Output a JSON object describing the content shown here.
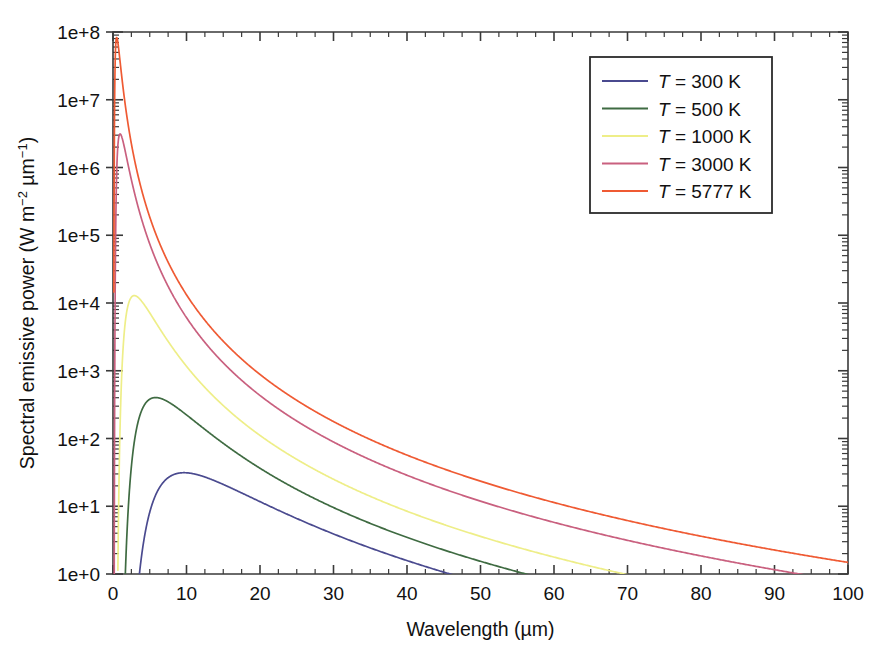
{
  "chart_data": {
    "type": "line",
    "title": "",
    "xlabel": "Wavelength (µm)",
    "ylabel": "Spectral emissive power (W m⁻² µm⁻¹)",
    "ylabel_parts": {
      "main": "Spectral emissive power (W m",
      "sup1": "−2",
      "mid": " µm",
      "sup2": "−1",
      "tail": ")"
    },
    "xlim": [
      0,
      100
    ],
    "ylim": [
      1,
      100000000
    ],
    "yscale": "log",
    "xscale": "linear",
    "grid": false,
    "legend_position": "upper right",
    "x_ticks": [
      0,
      10,
      20,
      30,
      40,
      50,
      60,
      70,
      80,
      90,
      100
    ],
    "x_tick_labels": [
      "0",
      "10",
      "20",
      "30",
      "40",
      "50",
      "60",
      "70",
      "80",
      "90",
      "100"
    ],
    "x_minor_step": 2.5,
    "y_ticks": [
      1,
      10,
      100,
      1000,
      10000,
      100000,
      1000000,
      10000000,
      100000000
    ],
    "y_tick_labels": [
      "1e+0",
      "1e+1",
      "1e+2",
      "1e+3",
      "1e+4",
      "1e+5",
      "1e+6",
      "1e+7",
      "1e+8"
    ],
    "series": [
      {
        "name": "T = 300 K",
        "label_prefix": "T",
        "label_eq": "=",
        "label_value": "300 K",
        "temperature": 300,
        "color": "#4a4a8f",
        "peak_wavelength_um": 9.66,
        "peak_value": 31.0,
        "x": [
          0.5,
          1,
          1.5,
          2,
          2.5,
          3,
          3.5,
          4,
          4.5,
          5,
          6,
          7,
          8,
          9,
          9.66,
          10,
          11,
          12,
          14,
          16,
          18,
          20,
          24,
          28,
          32,
          36,
          40,
          44,
          45.5
        ],
        "y": [
          2.6e-15,
          8.8e-07,
          0.000573,
          0.0202,
          0.1627,
          0.6299,
          1.6127,
          3.2155,
          5.4263,
          7.9853,
          14.03,
          19.54,
          24.02,
          27.24,
          28.53,
          29.04,
          30.0,
          30.1,
          28.15,
          24.9,
          21.5,
          18.3,
          13.1,
          9.4,
          6.9,
          5.2,
          3.97,
          3.08,
          2.84
        ]
      },
      {
        "name": "T = 500 K",
        "label_prefix": "T",
        "label_eq": "=",
        "label_value": "500 K",
        "temperature": 500,
        "color": "#3f6b42",
        "peak_wavelength_um": 5.8,
        "peak_value": 410.0,
        "x": [
          0.5,
          1,
          1.5,
          2,
          2.5,
          3,
          3.5,
          4,
          4.5,
          5,
          5.5,
          5.8,
          6,
          7,
          8,
          9,
          10,
          12,
          14,
          17,
          20,
          25,
          30,
          36,
          42,
          50,
          56
        ],
        "y": [
          1.5e-06,
          0.313,
          8.05,
          36.5,
          82.5,
          139.6,
          195.8,
          245.1,
          285.3,
          316.3,
          339.0,
          348.0,
          353.2,
          363.0,
          359.4,
          348.0,
          332.8,
          297.0,
          261.0,
          212.0,
          172.0,
          123.0,
          90.0,
          64.0,
          47.0,
          32.0,
          24.5
        ]
      },
      {
        "name": "T = 1000 K",
        "label_prefix": "T",
        "label_eq": "=",
        "label_value": "1000 K",
        "temperature": 1000,
        "color": "#eeee88",
        "peak_wavelength_um": 2.9,
        "peak_value": 12800.0,
        "x": [
          0.4,
          0.6,
          0.8,
          1,
          1.25,
          1.5,
          1.75,
          2,
          2.25,
          2.5,
          2.9,
          3.2,
          3.6,
          4,
          5,
          6,
          7,
          8,
          10,
          12,
          15,
          20,
          26,
          33,
          42,
          52,
          62,
          69
        ]
      },
      {
        "name": "T = 3000 K",
        "label_prefix": "T",
        "label_eq": "=",
        "label_value": "3000 K",
        "temperature": 3000,
        "color": "#c9607f",
        "peak_wavelength_um": 0.966,
        "peak_value": 3100000.0,
        "x": [
          0.3,
          0.4,
          0.5,
          0.6,
          0.7,
          0.8,
          0.9,
          0.966,
          1.1,
          1.3,
          1.6,
          2,
          2.5,
          3,
          4,
          5,
          7,
          9,
          12,
          16,
          22,
          30,
          40,
          55,
          70,
          85,
          92
        ]
      },
      {
        "name": "T = 5777 K",
        "label_prefix": "T",
        "label_eq": "=",
        "label_value": "5777 K",
        "temperature": 5777,
        "color": "#ef5a33",
        "peak_wavelength_um": 0.5016,
        "peak_value": 83000000.0,
        "x": [
          0.35,
          0.4,
          0.45,
          0.5016,
          0.55,
          0.6,
          0.7,
          0.8,
          1,
          1.3,
          1.7,
          2.2,
          3,
          4,
          5.5,
          7.5,
          10,
          14,
          20,
          28,
          40,
          55,
          70,
          85,
          100
        ]
      }
    ]
  },
  "legend": {
    "entries": [
      {
        "prefix": "T",
        "eq": "=",
        "value": "300 K",
        "color": "#4a4a8f"
      },
      {
        "prefix": "T",
        "eq": "=",
        "value": "500 K",
        "color": "#3f6b42"
      },
      {
        "prefix": "T",
        "eq": "=",
        "value": "1000 K",
        "color": "#eeee88"
      },
      {
        "prefix": "T",
        "eq": "=",
        "value": "3000 K",
        "color": "#c9607f"
      },
      {
        "prefix": "T",
        "eq": "=",
        "value": "5777 K",
        "color": "#ef5a33"
      }
    ]
  },
  "colors": {
    "background": "#ffffff",
    "axis": "#3a3a3a",
    "text": "#111111",
    "legend_border": "#2b2b2b"
  }
}
